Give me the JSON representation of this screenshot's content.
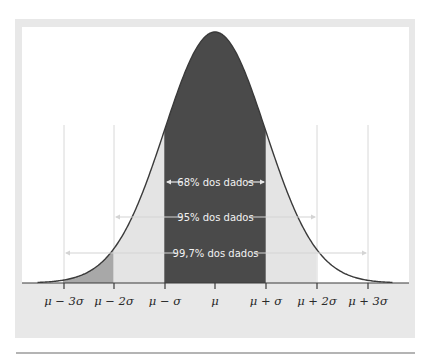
{
  "chart_data": {
    "type": "area",
    "title": "",
    "xlabel": "",
    "ylabel": "",
    "grid": false,
    "x_ticks": [
      "μ − 3σ",
      "μ − 2σ",
      "μ − σ",
      "μ",
      "μ + σ",
      "μ + 2σ",
      "μ + 3σ"
    ],
    "x_range_sigma": [
      -3.5,
      3.5
    ],
    "regions": [
      {
        "from_sigma": -1,
        "to_sigma": 1,
        "label": "68% dos dados",
        "fill": "#4a4a4a"
      },
      {
        "from_sigma": -2,
        "to_sigma": 2,
        "label": "95% dos dados",
        "fill": "#e4e4e4"
      },
      {
        "from_sigma": -3,
        "to_sigma": 3,
        "label": "99,7% dos dados",
        "fill": "#a8a8a8"
      }
    ],
    "colors": {
      "curve": "#3a3a3a",
      "center": "#4a4a4a",
      "middle": "#e4e4e4",
      "tail": "#a8a8a8",
      "panel": "#e8e8e8",
      "arrow": "#d0d0d0",
      "guide": "#d8d8d8"
    }
  },
  "labels": {
    "ticks": [
      "μ − 3σ",
      "μ − 2σ",
      "μ − σ",
      "μ",
      "μ + σ",
      "μ + 2σ",
      "μ + 3σ"
    ],
    "pct68": "68% dos dados",
    "pct95": "95% dos dados",
    "pct997": "99,7% dos dados"
  }
}
